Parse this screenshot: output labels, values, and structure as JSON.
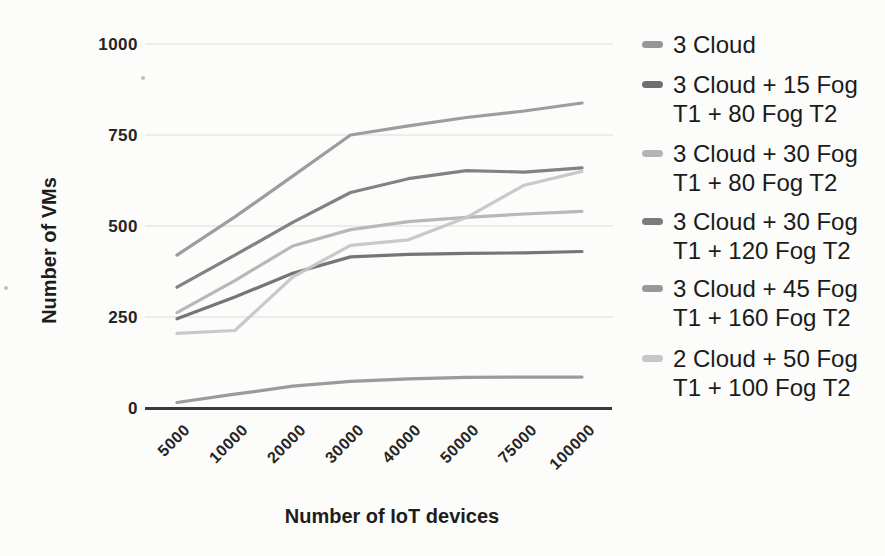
{
  "chart_data": {
    "type": "line",
    "title": "",
    "xlabel": "Number of IoT devices",
    "ylabel": "Number of VMs",
    "categories": [
      "5000",
      "10000",
      "20000",
      "30000",
      "40000",
      "50000",
      "75000",
      "100000"
    ],
    "y_ticks": [
      0,
      250,
      500,
      750,
      1000
    ],
    "ylim": [
      0,
      1000
    ],
    "grid": true,
    "legend_position": "right",
    "series": [
      {
        "name": "3 Cloud",
        "color": "#969696",
        "values": [
          15,
          38,
          60,
          73,
          80,
          84,
          85,
          85
        ]
      },
      {
        "name": "3 Cloud + 15 Fog T1 + 80 Fog T2",
        "color": "#6e6e6e",
        "values": [
          245,
          305,
          370,
          415,
          422,
          425,
          426,
          430
        ]
      },
      {
        "name": "3 Cloud + 30 Fog T1 + 80 Fog T2",
        "color": "#b4b4b4",
        "values": [
          262,
          350,
          445,
          490,
          512,
          524,
          533,
          540
        ]
      },
      {
        "name": "3 Cloud + 30 Fog T1 + 120 Fog T2",
        "color": "#7b7b7b",
        "values": [
          332,
          420,
          510,
          592,
          630,
          652,
          648,
          660
        ]
      },
      {
        "name": "3 Cloud + 45 Fog T1 + 160 Fog T2",
        "color": "#989898",
        "values": [
          420,
          525,
          637,
          750,
          775,
          798,
          816,
          838
        ]
      },
      {
        "name": "2 Cloud + 50 Fog T1 + 100 Fog T2",
        "color": "#c6c6c6",
        "values": [
          205,
          213,
          360,
          447,
          462,
          523,
          612,
          650
        ]
      }
    ]
  },
  "colors": {
    "background": "#fcfcfa",
    "gridline": "#dcdcdc",
    "axis_line": "#3a3a3a",
    "text": "#1d1d1d"
  }
}
